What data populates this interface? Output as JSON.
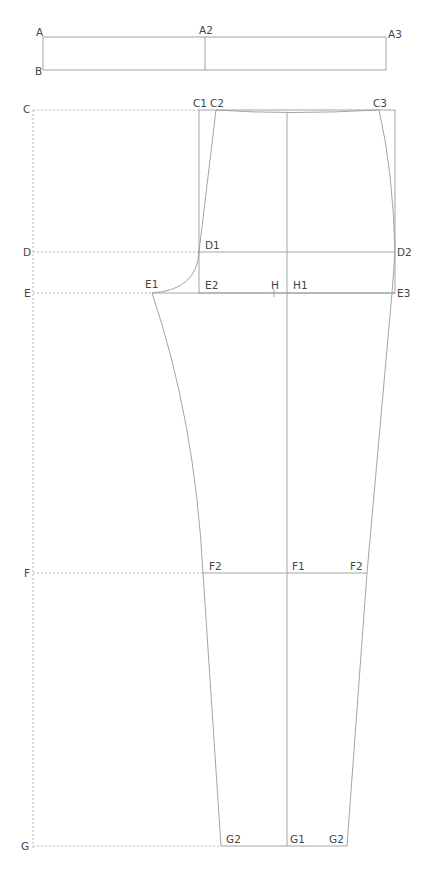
{
  "title": "",
  "diagram": {
    "type": "trouser front pattern draft",
    "colors": {
      "line": "#9a9a9a",
      "guide": "#b0b0b0",
      "label": "#444444"
    },
    "waistband": {
      "labels": [
        "A",
        "A2",
        "A3",
        "B"
      ]
    },
    "guide_labels": [
      "C",
      "D",
      "E",
      "F",
      "G"
    ],
    "pattern_labels": {
      "C1": "C1",
      "C2": "C2",
      "C3": "C3",
      "D1": "D1",
      "D2": "D2",
      "E1": "E1",
      "E2": "E2",
      "E3": "E3",
      "H": "H",
      "H1": "H1",
      "F1": "F1",
      "F2L": "F2",
      "F2R": "F2",
      "G1": "G1",
      "G2L": "G2",
      "G2R": "G2"
    }
  },
  "labels": {
    "A": "A",
    "A2": "A2",
    "A3": "A3",
    "B": "B",
    "C": "C",
    "D": "D",
    "E": "E",
    "F": "F",
    "G": "G",
    "C1": "C1",
    "C2": "C2",
    "C3": "C3",
    "D1": "D1",
    "D2": "D2",
    "E1": "E1",
    "E2": "E2",
    "E3": "E3",
    "H": "H",
    "H1": "H1",
    "F1": "F1",
    "F2": "F2",
    "G1": "G1",
    "G2": "G2"
  }
}
